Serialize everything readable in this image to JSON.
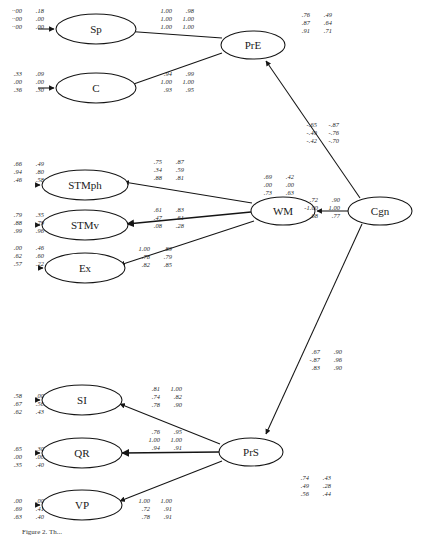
{
  "diagram": {
    "type": "structural-equation-path-diagram",
    "nodes": [
      {
        "id": "Sp",
        "label": "Sp",
        "cx": 96,
        "cy": 29,
        "rx": 40,
        "ry": 15
      },
      {
        "id": "C",
        "label": "C",
        "cx": 96,
        "cy": 88,
        "rx": 40,
        "ry": 15
      },
      {
        "id": "STMph",
        "label": "STMph",
        "cx": 85,
        "cy": 185,
        "rx": 43,
        "ry": 15
      },
      {
        "id": "STMv",
        "label": "STMv",
        "cx": 85,
        "cy": 225,
        "rx": 43,
        "ry": 15
      },
      {
        "id": "Ex",
        "label": "Ex",
        "cx": 85,
        "cy": 268,
        "rx": 40,
        "ry": 15
      },
      {
        "id": "SI",
        "label": "SI",
        "cx": 82,
        "cy": 400,
        "rx": 40,
        "ry": 15
      },
      {
        "id": "QR",
        "label": "QR",
        "cx": 82,
        "cy": 453,
        "rx": 40,
        "ry": 15
      },
      {
        "id": "VP",
        "label": "VP",
        "cx": 82,
        "cy": 505,
        "rx": 40,
        "ry": 15
      },
      {
        "id": "PrE",
        "label": "PrE",
        "cx": 253,
        "cy": 45,
        "rx": 32,
        "ry": 14
      },
      {
        "id": "WM",
        "label": "WM",
        "cx": 283,
        "cy": 211,
        "rx": 32,
        "ry": 14
      },
      {
        "id": "PrS",
        "label": "PrS",
        "cx": 251,
        "cy": 452,
        "rx": 32,
        "ry": 14
      },
      {
        "id": "Cgn",
        "label": "Cgn",
        "cx": 380,
        "cy": 211,
        "rx": 32,
        "ry": 14
      }
    ],
    "coefficient_blocks": [
      {
        "id": "sp-left",
        "target": "Sp",
        "side": "left",
        "x": 5,
        "y": 7,
        "rows": [
          [
            "··00",
            ".18"
          ],
          [
            "··00",
            ".00"
          ],
          [
            "··00",
            ".00"
          ]
        ]
      },
      {
        "id": "sp-right",
        "target": "Sp",
        "side": "right",
        "x": 155,
        "y": 7,
        "rows": [
          [
            "1.00",
            ".98"
          ],
          [
            "1.00",
            "1.00"
          ],
          [
            "1.00",
            "1.00"
          ]
        ]
      },
      {
        "id": "c-left",
        "target": "C",
        "side": "left",
        "x": 5,
        "y": 70,
        "rows": [
          [
            ".33",
            ".09"
          ],
          [
            ".00",
            ".00"
          ],
          [
            ".36",
            ".30"
          ]
        ]
      },
      {
        "id": "c-right",
        "target": "C",
        "side": "right",
        "x": 155,
        "y": 70,
        "rows": [
          [
            ".94",
            ".99"
          ],
          [
            "1.00",
            "1.00"
          ],
          [
            ".93",
            ".95"
          ]
        ]
      },
      {
        "id": "pre-right",
        "target": "PrE",
        "side": "right",
        "x": 293,
        "y": 11,
        "rows": [
          [
            ".76",
            ".49"
          ],
          [
            ".87",
            ".64"
          ],
          [
            ".91",
            ".71"
          ]
        ]
      },
      {
        "id": "cgn-pre",
        "target": "PrE",
        "side": "path",
        "x": 300,
        "y": 121,
        "rows": [
          [
            "-.65",
            "-.87"
          ],
          [
            "-.49",
            "-.76"
          ],
          [
            "-.42",
            "-.70"
          ]
        ]
      },
      {
        "id": "stmph-left",
        "target": "STMph",
        "side": "left",
        "x": 5,
        "y": 160,
        "rows": [
          [
            ".66",
            ".49"
          ],
          [
            ".94",
            ".80"
          ],
          [
            ".46",
            ".58"
          ]
        ]
      },
      {
        "id": "stmph-mid",
        "target": "STMph",
        "side": "right",
        "x": 145,
        "y": 158,
        "rows": [
          [
            ".75",
            ".87"
          ],
          [
            ".34",
            ".59"
          ],
          [
            ".88",
            ".81"
          ]
        ]
      },
      {
        "id": "stmv-left",
        "target": "STMv",
        "side": "left",
        "x": 5,
        "y": 211,
        "rows": [
          [
            ".79",
            ".35"
          ],
          [
            ".88",
            ".79"
          ],
          [
            ".99",
            ".96"
          ]
        ]
      },
      {
        "id": "stmv-mid",
        "target": "STMv",
        "side": "right",
        "x": 145,
        "y": 206,
        "rows": [
          [
            ".61",
            ".83"
          ],
          [
            ".47",
            ".61"
          ],
          [
            ".08",
            ".28"
          ]
        ]
      },
      {
        "id": "ex-left",
        "target": "Ex",
        "side": "left",
        "x": 5,
        "y": 244,
        "rows": [
          [
            ".00",
            ".46"
          ],
          [
            ".62",
            ".60"
          ],
          [
            ".57",
            ".22"
          ]
        ]
      },
      {
        "id": "ex-mid",
        "target": "Ex",
        "side": "right",
        "x": 133,
        "y": 245,
        "rows": [
          [
            "1.00",
            ".89"
          ],
          [
            ".78",
            ".79"
          ],
          [
            ".82",
            ".85"
          ]
        ]
      },
      {
        "id": "wm-top",
        "target": "WM",
        "side": "right",
        "x": 255,
        "y": 173,
        "rows": [
          [
            ".69",
            ".42"
          ],
          [
            ".00",
            ".00"
          ],
          [
            ".73",
            ".63"
          ]
        ]
      },
      {
        "id": "cgn-wm",
        "target": "WM",
        "side": "path",
        "x": 301,
        "y": 196,
        "rows": [
          [
            ".72",
            ".90"
          ],
          [
            "-1.00",
            "1.00"
          ],
          [
            ".68",
            ".77"
          ]
        ]
      },
      {
        "id": "cgn-prs",
        "target": "PrS",
        "side": "path",
        "x": 303,
        "y": 348,
        "rows": [
          [
            ".67",
            ".90"
          ],
          [
            "-.87",
            ".96"
          ],
          [
            ".83",
            ".90"
          ]
        ]
      },
      {
        "id": "si-left",
        "target": "SI",
        "side": "left",
        "x": 5,
        "y": 392,
        "rows": [
          [
            ".58",
            ".00"
          ],
          [
            ".67",
            ".56"
          ],
          [
            ".62",
            ".43"
          ]
        ]
      },
      {
        "id": "si-mid",
        "target": "SI",
        "side": "right",
        "x": 143,
        "y": 385,
        "rows": [
          [
            ".81",
            "1.00"
          ],
          [
            ".74",
            ".82"
          ],
          [
            ".78",
            ".90"
          ]
        ]
      },
      {
        "id": "qr-left",
        "target": "QR",
        "side": "left",
        "x": 5,
        "y": 445,
        "rows": [
          [
            ".65",
            ".30"
          ],
          [
            ".00",
            ".00"
          ],
          [
            ".35",
            ".40"
          ]
        ]
      },
      {
        "id": "qr-mid",
        "target": "QR",
        "side": "right",
        "x": 143,
        "y": 428,
        "rows": [
          [
            ".76",
            ".95"
          ],
          [
            "1.00",
            "1.00"
          ],
          [
            ".94",
            ".91"
          ]
        ]
      },
      {
        "id": "vp-left",
        "target": "VP",
        "side": "left",
        "x": 5,
        "y": 497,
        "rows": [
          [
            ".00",
            ".00"
          ],
          [
            ".69",
            ".41"
          ],
          [
            ".63",
            ".40"
          ]
        ]
      },
      {
        "id": "vp-right",
        "target": "VP",
        "side": "right",
        "x": 133,
        "y": 497,
        "rows": [
          [
            "1.00",
            "1.00"
          ],
          [
            ".72",
            ".91"
          ],
          [
            ".78",
            ".91"
          ]
        ]
      },
      {
        "id": "prs-right",
        "target": "PrS",
        "side": "right",
        "x": 292,
        "y": 474,
        "rows": [
          [
            ".74",
            ".43"
          ],
          [
            ".49",
            ".28"
          ],
          [
            ".56",
            ".44"
          ]
        ]
      }
    ],
    "caption": "Figure 2. Th..."
  }
}
